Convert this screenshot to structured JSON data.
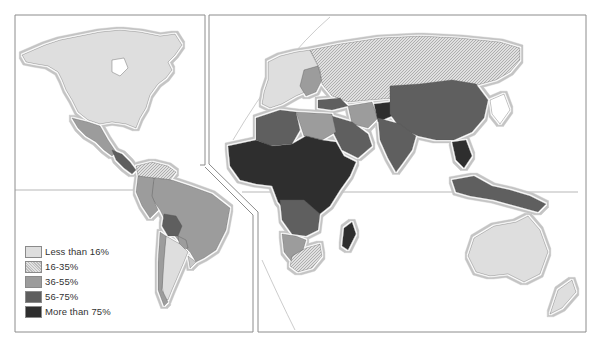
{
  "map": {
    "type": "choropleth",
    "subject": "World map shaded by percentage category",
    "panels": [
      "Americas",
      "Europe-Africa-Asia-Oceania"
    ]
  },
  "legend": {
    "items": [
      {
        "label": "Less than 16%",
        "color": "#dedede",
        "pattern": "solid"
      },
      {
        "label": "16-35%",
        "color": "#c8c8c8",
        "pattern": "hatch"
      },
      {
        "label": "36-55%",
        "color": "#9c9c9c",
        "pattern": "solid"
      },
      {
        "label": "56-75%",
        "color": "#5e5e5e",
        "pattern": "solid"
      },
      {
        "label": "More than 75%",
        "color": "#2e2e2e",
        "pattern": "solid"
      }
    ]
  },
  "colors": {
    "lt16": "#dedede",
    "c16_35": "#c8c8c8",
    "c36_55": "#9c9c9c",
    "c56_75": "#5e5e5e",
    "gt75": "#2e2e2e",
    "no_data": "#ffffff",
    "frame": "#8c8c8c",
    "coast_halo": "#b8b8b8"
  }
}
